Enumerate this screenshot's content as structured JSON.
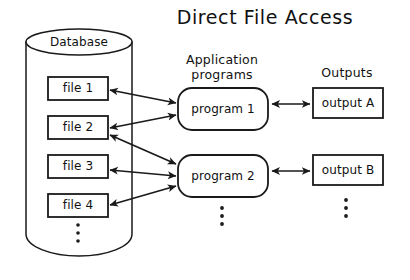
{
  "diagram": {
    "title": "Direct File Access",
    "type": "data-flow-diagram",
    "background_color": "#ffffff",
    "line_color": "#1a1a1a"
  },
  "database": {
    "label": "Database",
    "files": [
      {
        "label": "file 1"
      },
      {
        "label": "file 2"
      },
      {
        "label": "file 3"
      },
      {
        "label": "file 4"
      }
    ],
    "continuation": "vertical-ellipsis"
  },
  "applications": {
    "heading_line1": "Application",
    "heading_line2": "programs",
    "programs": [
      {
        "label": "program 1"
      },
      {
        "label": "program 2"
      }
    ],
    "continuation": "vertical-ellipsis"
  },
  "outputs": {
    "heading": "Outputs",
    "items": [
      {
        "label": "output A"
      },
      {
        "label": "output B"
      }
    ],
    "continuation": "vertical-ellipsis"
  },
  "connections": [
    {
      "from": "file 1",
      "to": "program 1",
      "style": "double-arrow"
    },
    {
      "from": "file 2",
      "to": "program 1",
      "style": "double-arrow"
    },
    {
      "from": "file 2",
      "to": "program 2",
      "style": "double-arrow"
    },
    {
      "from": "file 3",
      "to": "program 2",
      "style": "double-arrow"
    },
    {
      "from": "file 4",
      "to": "program 2",
      "style": "double-arrow"
    },
    {
      "from": "program 1",
      "to": "output A",
      "style": "double-arrow"
    },
    {
      "from": "program 2",
      "to": "output B",
      "style": "double-arrow"
    }
  ]
}
